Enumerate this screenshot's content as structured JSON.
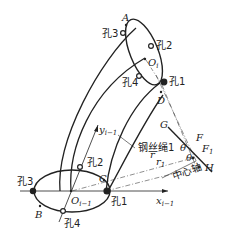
{
  "diagram": {
    "type": "mechanism-geometry",
    "colors": {
      "stroke": "#222222",
      "background": "#ffffff"
    },
    "upper_ellipse": {
      "points": {
        "A": "A",
        "O_i": "O",
        "O_i_sub": "i",
        "D": "D"
      },
      "holes": {
        "hole1": "孔1",
        "hole2": "孔2",
        "hole3": "孔3",
        "hole4": "孔4"
      }
    },
    "lower_ellipse": {
      "points": {
        "B": "B",
        "C": "C",
        "O_im1": "O",
        "O_im1_sub": "i−1"
      },
      "holes": {
        "hole1": "孔1",
        "hole2": "孔2",
        "hole3": "孔3",
        "hole4": "孔4"
      },
      "axes": {
        "x": "x",
        "x_sub": "i−1",
        "y": "y",
        "y_sub": "i−1"
      }
    },
    "annotations": {
      "wire_rope": "钢丝绳1",
      "center_axis": "中心轴",
      "G": "G",
      "F": "F",
      "F1": "F",
      "F1_sub": "1",
      "H": "H",
      "theta1": "θ",
      "theta2": "θ",
      "r": "r",
      "r1": "r",
      "r1_sub": "1"
    }
  }
}
